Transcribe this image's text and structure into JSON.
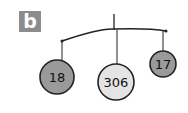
{
  "panel": {
    "label": "b"
  },
  "mobile": {
    "colors": {
      "stroke": "#222222",
      "dark_fill": "#9a9a9a",
      "light_fill": "#e4e4e4",
      "label_bg": "#8c8c8c"
    },
    "nodes": [
      {
        "value": "18",
        "shade": "dark"
      },
      {
        "value": "306",
        "shade": "light"
      },
      {
        "value": "17",
        "shade": "dark"
      }
    ]
  }
}
